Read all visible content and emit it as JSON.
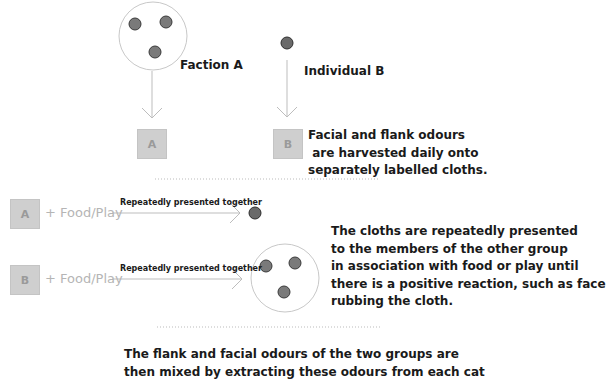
{
  "top": {
    "faction_label": "Faction A",
    "individual_label": "Individual B",
    "box_a": "A",
    "box_b": "B",
    "harvest_text": "Facial and flank odours\n are harvested daily onto\nseparately labelled cloths."
  },
  "middle": {
    "row_a": {
      "box": "A",
      "food": "+ Food/Play",
      "arrow_label": "Repeatedly presented together"
    },
    "row_b": {
      "box": "B",
      "food": "+ Food/Play",
      "arrow_label": "Repeatedly presented together"
    },
    "presentation_text": "The cloths are repeatedly presented\nto the members of the other group\nin association with food or play until\nthere is a positive reaction, such as face\nrubbing the cloth."
  },
  "bottom": {
    "mix_text": "The flank and facial odours of the two groups are\nthen mixed by extracting these odours from each cat"
  },
  "colors": {
    "cat_fill": "#6e6e6e",
    "cat_stroke": "#3a3a3a",
    "line": "#bdbdbd",
    "box_fill": "#cfcfcf",
    "food_text": "#b5b5b5"
  }
}
